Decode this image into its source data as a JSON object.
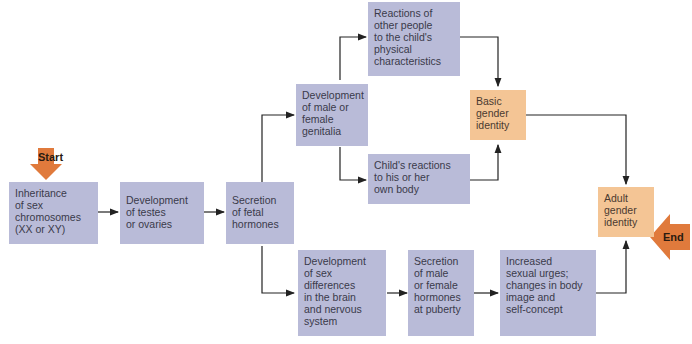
{
  "diagram": {
    "start_label": "Start",
    "end_label": "End",
    "nodes": {
      "inheritance": "Inheritance\nof sex\nchromosomes\n(XX or XY)",
      "testes": "Development\nof testes\nor ovaries",
      "fetal": "Secretion\nof  fetal\nhormones",
      "genitalia": "Development\nof male or\nfemale\ngenitalia",
      "reactions_others": "Reactions of\nother people\nto the child's\nphysical\ncharacteristics",
      "reactions_child": "Child's reactions\nto his or her\nown body",
      "basic_identity": "Basic\ngender\nidentity",
      "brain": "Development\nof sex\ndifferences\nin the brain\nand nervous\nsystem",
      "puberty": "Secretion\nof male\nor female\nhormones\nat puberty",
      "urges": "Increased\nsexual urges;\nchanges in body\nimage and\nself-concept",
      "adult_identity": "Adult\ngender\nidentity"
    },
    "colors": {
      "process": "#b9bbd8",
      "identity": "#f4c595",
      "marker": "#e07a3c",
      "line": "#222222"
    }
  }
}
